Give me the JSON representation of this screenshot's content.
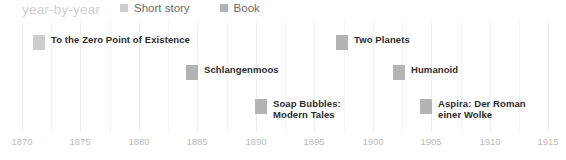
{
  "header": {
    "title": "year-by-year"
  },
  "legend": {
    "items": [
      {
        "label": "Short story",
        "color": "#cdcdcd",
        "icon": "square-swatch-icon"
      },
      {
        "label": "Book",
        "color": "#b3b3b3",
        "icon": "square-swatch-icon"
      }
    ]
  },
  "chart_data": {
    "type": "scatter",
    "title": "year-by-year",
    "xlabel": "",
    "ylabel": "",
    "xlim": [
      1870,
      1915
    ],
    "grid": true,
    "legend_position": "top",
    "tick_step": 5,
    "xticks": [
      "1870",
      "1875",
      "1880",
      "1885",
      "1890",
      "1895",
      "1900",
      "1905",
      "1910",
      "1915"
    ],
    "series": [
      {
        "name": "Book",
        "color": "#b3b3b3",
        "points": [
          {
            "label": "To the Zero Point of Existence",
            "label_line2": "",
            "year": 1871,
            "row": 0
          },
          {
            "label": "Two Planets",
            "label_line2": "",
            "year": 1897,
            "row": 0
          },
          {
            "label": "Schlangenmoos",
            "label_line2": "",
            "year": 1884,
            "row": 1
          },
          {
            "label": "Humanoid",
            "label_line2": "",
            "year": 1902,
            "row": 1
          },
          {
            "label": "Soap Bubbles:",
            "label_line2": "Modern Tales",
            "year": 1890,
            "row": 2
          },
          {
            "label": "Aspira: Der Roman",
            "label_line2": "einer Wolke",
            "year": 1904,
            "row": 2
          }
        ]
      }
    ]
  },
  "events": [
    {
      "label": "To the Zero Point of Existence",
      "label_line2": "",
      "color": "#cdcdcd",
      "x": 33,
      "y": 12
    },
    {
      "label": "Two Planets",
      "label_line2": "",
      "color": "#b3b3b3",
      "x": 336,
      "y": 12
    },
    {
      "label": "Schlangenmoos",
      "label_line2": "",
      "color": "#b3b3b3",
      "x": 186,
      "y": 42
    },
    {
      "label": "Humanoid",
      "label_line2": "",
      "color": "#b3b3b3",
      "x": 393,
      "y": 42
    },
    {
      "label": "Soap Bubbles:",
      "label_line2": "Modern Tales",
      "color": "#b3b3b3",
      "x": 255,
      "y": 76
    },
    {
      "label": "Aspira: Der Roman",
      "label_line2": "einer Wolke",
      "color": "#b3b3b3",
      "x": 420,
      "y": 76
    }
  ],
  "axis": {
    "ticks": [
      {
        "label": "1870",
        "x": 22
      },
      {
        "label": "1875",
        "x": 80
      },
      {
        "label": "1880",
        "x": 139
      },
      {
        "label": "1885",
        "x": 197
      },
      {
        "label": "1890",
        "x": 256
      },
      {
        "label": "1895",
        "x": 314
      },
      {
        "label": "1900",
        "x": 373
      },
      {
        "label": "1905",
        "x": 431
      },
      {
        "label": "1910",
        "x": 490
      },
      {
        "label": "1915",
        "x": 548
      }
    ]
  },
  "gridlines": {
    "major_x": [
      22,
      80,
      139,
      197,
      256,
      314,
      373,
      431,
      490,
      548
    ],
    "minor_x": [
      51,
      110,
      168,
      227,
      285,
      344,
      402,
      461,
      519
    ]
  }
}
